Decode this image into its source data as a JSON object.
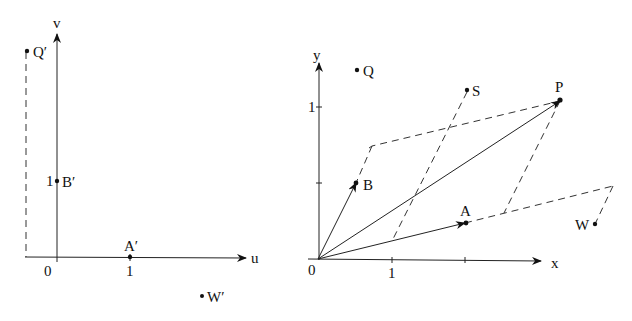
{
  "left_panel": {
    "axes": {
      "horizontal_label": "u",
      "vertical_label": "v",
      "origin_label": "0",
      "tick_u_label": "1",
      "tick_v_label": "1"
    },
    "points": [
      {
        "name": "Q'",
        "label": "Q′"
      },
      {
        "name": "B'",
        "label": "B′"
      },
      {
        "name": "A'",
        "label": "A′"
      },
      {
        "name": "W'",
        "label": "W′"
      }
    ]
  },
  "right_panel": {
    "axes": {
      "horizontal_label": "x",
      "vertical_label": "y",
      "origin_label": "0",
      "tick_x_label": "1",
      "tick_y_label": "1"
    },
    "points": [
      {
        "name": "Q",
        "label": "Q"
      },
      {
        "name": "S",
        "label": "S"
      },
      {
        "name": "P",
        "label": "P"
      },
      {
        "name": "B",
        "label": "B"
      },
      {
        "name": "A",
        "label": "A"
      },
      {
        "name": "W",
        "label": "W"
      }
    ]
  }
}
